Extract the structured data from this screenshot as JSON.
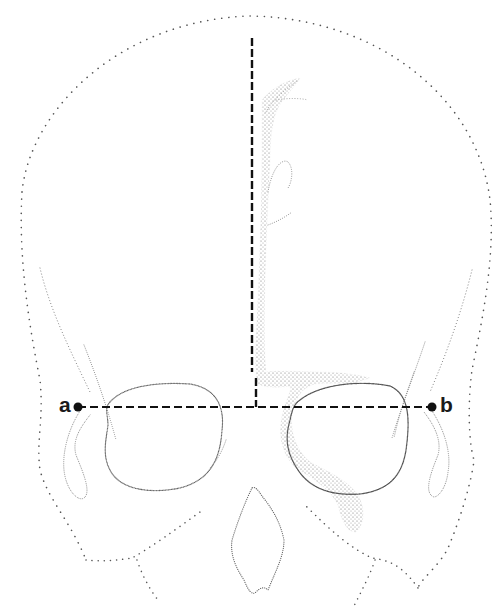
{
  "figure": {
    "labels": {
      "left_point": "a",
      "right_point": "b"
    },
    "measurement_line": {
      "from": "a",
      "to": "b",
      "style": "dashed",
      "y": 407
    },
    "midline": {
      "style": "dashed",
      "x": 252,
      "y_top": 38,
      "y_bottom": 407,
      "offset_segment_x": 256,
      "offset_segment_y_top": 378
    },
    "structures": [
      "cranial-outline",
      "left-orbit",
      "right-orbit",
      "nasal-aperture",
      "left-zygomatic-process",
      "right-zygomatic-process",
      "stippled-sinus-tract"
    ],
    "colors": {
      "outline": "#555555",
      "dashed_line": "#111111",
      "stipple": "#777777",
      "background": "#ffffff"
    }
  }
}
